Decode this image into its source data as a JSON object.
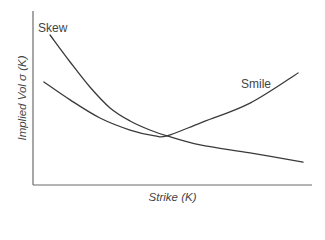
{
  "chart_data": {
    "type": "line",
    "title": "",
    "xlabel": "Strike (K)",
    "ylabel": "Implied Vol σ (K)",
    "xlim": [
      0,
      10
    ],
    "ylim": [
      0,
      10
    ],
    "grid": false,
    "ticks": false,
    "legend": null,
    "series": [
      {
        "name": "Skew",
        "color": "#3a3a3a",
        "label_pos": {
          "x": 38,
          "y": 21
        },
        "x": [
          0.61,
          1.33,
          2.04,
          2.76,
          3.48,
          4.19,
          4.8,
          5.99,
          7.78,
          9.68
        ],
        "y": [
          8.62,
          7.07,
          5.63,
          4.43,
          3.68,
          3.16,
          2.82,
          2.3,
          1.84,
          1.32
        ]
      },
      {
        "name": "Smile",
        "color": "#3a3a3a",
        "label_pos": {
          "x": 241,
          "y": 77
        },
        "x": [
          0.39,
          1.33,
          2.4,
          3.48,
          4.37,
          4.8,
          5.99,
          7.78,
          9.5
        ],
        "y": [
          5.92,
          4.89,
          3.85,
          3.16,
          2.82,
          2.82,
          3.56,
          4.71,
          6.44
        ]
      }
    ],
    "annotations": [
      "Skew",
      "Smile"
    ]
  },
  "plot_area": {
    "left": 33,
    "right": 312,
    "top": 11,
    "bottom": 185
  },
  "labels": {
    "x_axis": "Strike (K)",
    "y_axis": "Implied Vol σ (K)",
    "skew": "Skew",
    "smile": "Smile"
  }
}
